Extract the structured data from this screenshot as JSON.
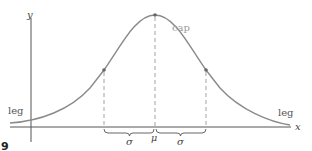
{
  "diagram": {
    "axes": {
      "x_label": "x",
      "y_label": "y"
    },
    "curve": {
      "type": "bell-curve",
      "color": "#8a8a8a",
      "peak_label": "cap",
      "left_tail_label": "leg",
      "right_tail_label": "leg"
    },
    "markers": {
      "mean_label": "μ",
      "left_sigma_label": "σ",
      "right_sigma_label": "σ"
    },
    "corner_mark": "9"
  }
}
